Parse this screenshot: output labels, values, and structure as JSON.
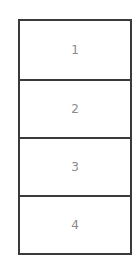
{
  "diagram": {
    "type": "vertical-stack",
    "cells": [
      {
        "label": "1"
      },
      {
        "label": "2"
      },
      {
        "label": "3"
      },
      {
        "label": "4"
      }
    ]
  }
}
